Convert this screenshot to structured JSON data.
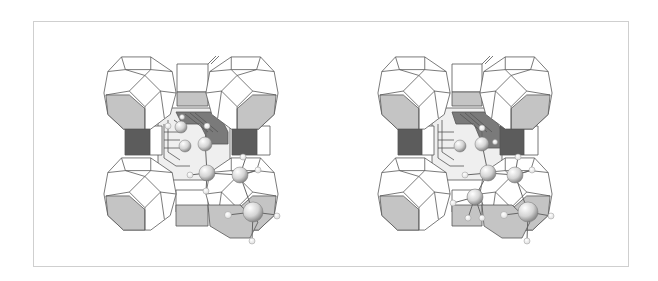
{
  "figure": {
    "type": "stereo-pair",
    "views": [
      {
        "label": "",
        "position": "left"
      },
      {
        "label": "",
        "position": "right"
      }
    ]
  },
  "colors": {
    "edge": "#555555",
    "face_white": "#ffffff",
    "face_gray": "#c4c4c4",
    "face_dark": "#7a7a7a",
    "atom_carbon": "#d8d8d8",
    "atom_hydrogen": "#ffffff",
    "frame_border": "#cfcfcf"
  }
}
